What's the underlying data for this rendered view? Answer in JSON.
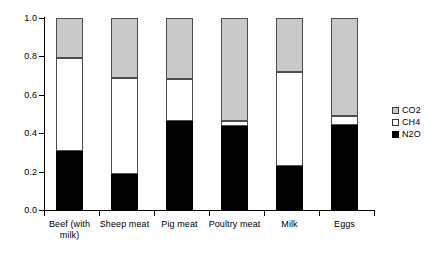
{
  "chart_data": {
    "type": "bar",
    "subtype": "stacked-bar-100pct",
    "title": "",
    "xlabel": "",
    "ylabel": "",
    "ylim": [
      0.0,
      1.0
    ],
    "grid": false,
    "legend_position": "right",
    "categories": [
      "Beef (with milk)",
      "Sheep meat",
      "Pig meat",
      "Poultry meat",
      "Milk",
      "Eggs"
    ],
    "ytick_labels": [
      "0.0",
      "0.2",
      "0.4",
      "0.6",
      "0.8",
      "1.0"
    ],
    "ytick_values": [
      0.0,
      0.2,
      0.4,
      0.6,
      0.8,
      1.0
    ],
    "series": [
      {
        "name": "N2O",
        "color": "#000000",
        "values": [
          0.305,
          0.19,
          0.465,
          0.435,
          0.23,
          0.445
        ]
      },
      {
        "name": "CH4",
        "color": "#ffffff",
        "values": [
          0.485,
          0.5,
          0.215,
          0.03,
          0.49,
          0.045
        ]
      },
      {
        "name": "CO2",
        "color": "#c9c9c9",
        "values": [
          0.21,
          0.31,
          0.32,
          0.535,
          0.28,
          0.51
        ]
      }
    ]
  },
  "legend": {
    "items": [
      {
        "label": "CO2",
        "swatch": "co2-swatch"
      },
      {
        "label": "CH4",
        "swatch": "ch4-swatch"
      },
      {
        "label": "N2O",
        "swatch": "n2o-swatch"
      }
    ]
  },
  "category_label_lines": [
    [
      "Beef (with",
      "milk)"
    ],
    [
      "Sheep meat",
      ""
    ],
    [
      "Pig meat",
      ""
    ],
    [
      "Poultry meat",
      ""
    ],
    [
      "Milk",
      ""
    ],
    [
      "Eggs",
      ""
    ]
  ]
}
